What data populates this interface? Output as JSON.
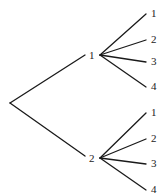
{
  "diagram": {
    "type": "tree",
    "root": {
      "x": 10,
      "y": 103
    },
    "branches": [
      {
        "label": "1",
        "label_pos": {
          "x": 89,
          "y": 59
        },
        "node": {
          "x": 100,
          "y": 55
        },
        "edge_start": {
          "x": 85,
          "y": 55
        },
        "leaves": [
          {
            "label": "1",
            "end": {
              "x": 146,
              "y": 14
            },
            "label_pos": {
              "x": 151,
              "y": 17
            }
          },
          {
            "label": "2",
            "end": {
              "x": 146,
              "y": 40
            },
            "label_pos": {
              "x": 151,
              "y": 43
            }
          },
          {
            "label": "3",
            "end": {
              "x": 146,
              "y": 62
            },
            "label_pos": {
              "x": 151,
              "y": 65
            }
          },
          {
            "label": "4",
            "end": {
              "x": 146,
              "y": 87
            },
            "label_pos": {
              "x": 151,
              "y": 90
            }
          }
        ]
      },
      {
        "label": "2",
        "label_pos": {
          "x": 89,
          "y": 162
        },
        "node": {
          "x": 100,
          "y": 158
        },
        "edge_start": {
          "x": 85,
          "y": 156
        },
        "leaves": [
          {
            "label": "1",
            "end": {
              "x": 146,
              "y": 113
            },
            "label_pos": {
              "x": 151,
              "y": 116
            }
          },
          {
            "label": "2",
            "end": {
              "x": 146,
              "y": 139
            },
            "label_pos": {
              "x": 151,
              "y": 142
            }
          },
          {
            "label": "3",
            "end": {
              "x": 146,
              "y": 164
            },
            "label_pos": {
              "x": 151,
              "y": 167
            }
          },
          {
            "label": "4",
            "end": {
              "x": 146,
              "y": 190
            },
            "label_pos": {
              "x": 151,
              "y": 193
            }
          }
        ]
      }
    ]
  }
}
